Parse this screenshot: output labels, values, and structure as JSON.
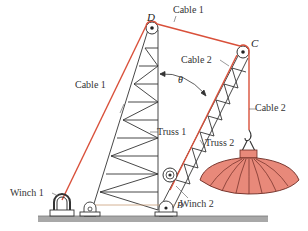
{
  "labels": {
    "point_d": "D",
    "point_c": "C",
    "point_b": "B",
    "theta": "θ",
    "cable1_top": "Cable 1",
    "cable1_left": "Cable 1",
    "cable2_upper": "Cable 2",
    "cable2_right": "Cable 2",
    "truss1": "Truss 1",
    "truss2": "Truss 2",
    "winch1": "Winch 1",
    "winch2": "Winch 2"
  },
  "colors": {
    "cable": "#d9503a",
    "structure": "#333333",
    "ground": "#9a9a9a",
    "load_fill": "#e8897a",
    "load_stroke": "#6b2a22"
  }
}
